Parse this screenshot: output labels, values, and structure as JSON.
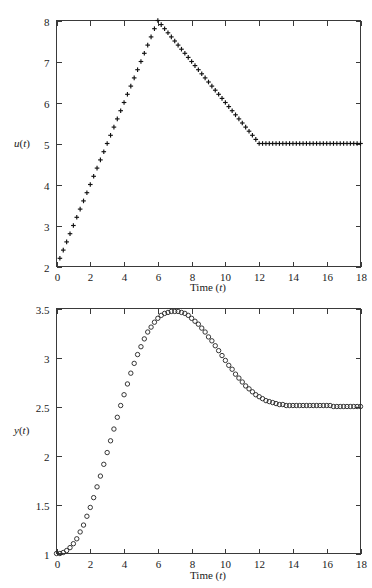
{
  "figure": {
    "background_color": "#ffffff",
    "marker_color": "#111111",
    "axis_color": "#3a3a3a"
  },
  "panels": [
    {
      "id": "u-panel",
      "ylabel_main": "u",
      "ylabel_paren_open": "(",
      "ylabel_var": "t",
      "ylabel_paren_close": ")",
      "xlabel_main": "Time ",
      "xlabel_paren_open": "(",
      "xlabel_var": "t",
      "xlabel_paren_close": ")",
      "x_ticks": [
        "0",
        "2",
        "4",
        "6",
        "8",
        "10",
        "12",
        "14",
        "16",
        "18"
      ],
      "y_ticks": [
        "2",
        "3",
        "4",
        "5",
        "6",
        "7",
        "8"
      ]
    },
    {
      "id": "y-panel",
      "ylabel_main": "y",
      "ylabel_paren_open": "(",
      "ylabel_var": "t",
      "ylabel_paren_close": ")",
      "xlabel_main": "Time ",
      "xlabel_paren_open": "(",
      "xlabel_var": "t",
      "xlabel_paren_close": ")",
      "x_ticks": [
        "0",
        "2",
        "4",
        "6",
        "8",
        "10",
        "12",
        "14",
        "16",
        "18"
      ],
      "y_ticks": [
        "1",
        "1.5",
        "2",
        "2.5",
        "3",
        "3.5"
      ]
    }
  ],
  "chart_data": [
    {
      "type": "scatter",
      "title": "",
      "xlabel": "Time (t)",
      "ylabel": "u(t)",
      "xlim": [
        0,
        18
      ],
      "ylim": [
        2,
        8
      ],
      "xticks": [
        0,
        2,
        4,
        6,
        8,
        10,
        12,
        14,
        16,
        18
      ],
      "yticks": [
        2,
        3,
        4,
        5,
        6,
        7,
        8
      ],
      "grid": false,
      "legend": null,
      "marker": "plus",
      "series": [
        {
          "name": "u(t)",
          "x": [
            0.2,
            0.4,
            0.6,
            0.8,
            1.0,
            1.2,
            1.4,
            1.6,
            1.8,
            2.0,
            2.2,
            2.4,
            2.6,
            2.8,
            3.0,
            3.2,
            3.4,
            3.6,
            3.8,
            4.0,
            4.2,
            4.4,
            4.6,
            4.8,
            5.0,
            5.2,
            5.4,
            5.6,
            5.8,
            6.0,
            6.2,
            6.4,
            6.6,
            6.8,
            7.0,
            7.2,
            7.4,
            7.6,
            7.8,
            8.0,
            8.2,
            8.4,
            8.6,
            8.8,
            9.0,
            9.2,
            9.4,
            9.6,
            9.8,
            10.0,
            10.2,
            10.4,
            10.6,
            10.8,
            11.0,
            11.2,
            11.4,
            11.6,
            11.8,
            12.0,
            12.2,
            12.4,
            12.6,
            12.8,
            13.0,
            13.2,
            13.4,
            13.6,
            13.8,
            14.0,
            14.2,
            14.4,
            14.6,
            14.8,
            15.0,
            15.2,
            15.4,
            15.6,
            15.8,
            16.0,
            16.2,
            16.4,
            16.6,
            16.8,
            17.0,
            17.2,
            17.4,
            17.6,
            17.8,
            18.0
          ],
          "y": [
            2.2,
            2.4,
            2.6,
            2.8,
            3.0,
            3.2,
            3.4,
            3.6,
            3.8,
            4.0,
            4.2,
            4.4,
            4.6,
            4.8,
            5.0,
            5.2,
            5.4,
            5.6,
            5.8,
            6.0,
            6.2,
            6.4,
            6.6,
            6.8,
            7.0,
            7.2,
            7.4,
            7.6,
            7.8,
            8.0,
            7.9,
            7.8,
            7.7,
            7.6,
            7.5,
            7.4,
            7.3,
            7.2,
            7.1,
            7.0,
            6.9,
            6.8,
            6.7,
            6.6,
            6.5,
            6.4,
            6.3,
            6.2,
            6.1,
            6.0,
            5.9,
            5.8,
            5.7,
            5.6,
            5.5,
            5.4,
            5.3,
            5.2,
            5.1,
            5.0,
            5.0,
            5.0,
            5.0,
            5.0,
            5.0,
            5.0,
            5.0,
            5.0,
            5.0,
            5.0,
            5.0,
            5.0,
            5.0,
            5.0,
            5.0,
            5.0,
            5.0,
            5.0,
            5.0,
            5.0,
            5.0,
            5.0,
            5.0,
            5.0,
            5.0,
            5.0,
            5.0,
            5.0,
            5.0,
            5.0
          ]
        }
      ]
    },
    {
      "type": "scatter",
      "title": "",
      "xlabel": "Time (t)",
      "ylabel": "y(t)",
      "xlim": [
        0,
        18
      ],
      "ylim": [
        1,
        3.5
      ],
      "xticks": [
        0,
        2,
        4,
        6,
        8,
        10,
        12,
        14,
        16,
        18
      ],
      "yticks": [
        1,
        1.5,
        2,
        2.5,
        3,
        3.5
      ],
      "grid": false,
      "legend": null,
      "marker": "circle",
      "series": [
        {
          "name": "y(t)",
          "x": [
            0.0,
            0.2,
            0.4,
            0.6,
            0.8,
            1.0,
            1.2,
            1.4,
            1.6,
            1.8,
            2.0,
            2.2,
            2.4,
            2.6,
            2.8,
            3.0,
            3.2,
            3.4,
            3.6,
            3.8,
            4.0,
            4.2,
            4.4,
            4.6,
            4.8,
            5.0,
            5.2,
            5.4,
            5.6,
            5.8,
            6.0,
            6.2,
            6.4,
            6.6,
            6.8,
            7.0,
            7.2,
            7.4,
            7.6,
            7.8,
            8.0,
            8.2,
            8.4,
            8.6,
            8.8,
            9.0,
            9.2,
            9.4,
            9.6,
            9.8,
            10.0,
            10.2,
            10.4,
            10.6,
            10.8,
            11.0,
            11.2,
            11.4,
            11.6,
            11.8,
            12.0,
            12.2,
            12.4,
            12.6,
            12.8,
            13.0,
            13.2,
            13.4,
            13.6,
            13.8,
            14.0,
            14.2,
            14.4,
            14.6,
            14.8,
            15.0,
            15.2,
            15.4,
            15.6,
            15.8,
            16.0,
            16.2,
            16.4,
            16.6,
            16.8,
            17.0,
            17.2,
            17.4,
            17.6,
            17.8,
            18.0
          ],
          "y": [
            1.0,
            1.0,
            1.01,
            1.03,
            1.06,
            1.1,
            1.15,
            1.22,
            1.29,
            1.38,
            1.47,
            1.57,
            1.68,
            1.79,
            1.91,
            2.03,
            2.15,
            2.27,
            2.39,
            2.51,
            2.62,
            2.73,
            2.84,
            2.94,
            3.03,
            3.11,
            3.19,
            3.26,
            3.31,
            3.36,
            3.4,
            3.43,
            3.45,
            3.46,
            3.47,
            3.47,
            3.47,
            3.46,
            3.45,
            3.43,
            3.4,
            3.37,
            3.34,
            3.3,
            3.26,
            3.21,
            3.17,
            3.12,
            3.07,
            3.02,
            2.97,
            2.92,
            2.88,
            2.83,
            2.79,
            2.75,
            2.71,
            2.68,
            2.65,
            2.62,
            2.6,
            2.58,
            2.56,
            2.55,
            2.54,
            2.53,
            2.52,
            2.52,
            2.51,
            2.51,
            2.51,
            2.51,
            2.51,
            2.51,
            2.51,
            2.51,
            2.51,
            2.51,
            2.51,
            2.51,
            2.51,
            2.51,
            2.5,
            2.5,
            2.5,
            2.5,
            2.5,
            2.5,
            2.5,
            2.5,
            2.5
          ]
        }
      ]
    }
  ]
}
